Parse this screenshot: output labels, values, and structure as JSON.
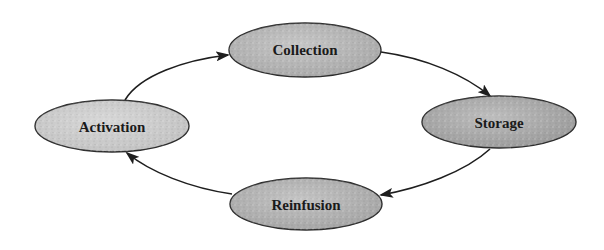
{
  "diagram": {
    "type": "cycle",
    "nodes": [
      {
        "id": "collection",
        "label": "Collection",
        "cx": 305,
        "cy": 50,
        "rx": 76,
        "ry": 27,
        "fill": "#a8a8a8"
      },
      {
        "id": "storage",
        "label": "Storage",
        "cx": 499,
        "cy": 122,
        "rx": 77,
        "ry": 26,
        "fill": "#9a9a9a"
      },
      {
        "id": "reinfusion",
        "label": "Reinfusion",
        "cx": 306,
        "cy": 204,
        "rx": 76,
        "ry": 26,
        "fill": "#a4a4a4"
      },
      {
        "id": "activation",
        "label": "Activation",
        "cx": 112,
        "cy": 126,
        "rx": 77,
        "ry": 26,
        "fill": "#c2c2c2"
      }
    ],
    "edges": [
      {
        "from": "activation",
        "to": "collection"
      },
      {
        "from": "collection",
        "to": "storage"
      },
      {
        "from": "storage",
        "to": "reinfusion"
      },
      {
        "from": "reinfusion",
        "to": "activation"
      }
    ],
    "colors": {
      "background": "#ffffff",
      "stroke": "#1e1e1e",
      "text": "#1a1a1a"
    }
  }
}
